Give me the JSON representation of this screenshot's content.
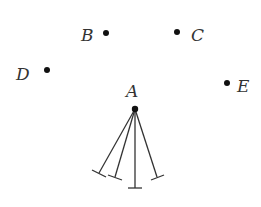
{
  "diagram": {
    "points": [
      {
        "id": "A",
        "label": "A",
        "x": 135,
        "y": 109,
        "lx": 126,
        "ly": 97
      },
      {
        "id": "B",
        "label": "B",
        "x": 106,
        "y": 33,
        "lx": 81,
        "ly": 41
      },
      {
        "id": "C",
        "label": "C",
        "x": 177,
        "y": 32,
        "lx": 191,
        "ly": 41
      },
      {
        "id": "D",
        "label": "D",
        "x": 47,
        "y": 70,
        "lx": 16,
        "ly": 80
      },
      {
        "id": "E",
        "label": "E",
        "x": 227,
        "y": 83,
        "lx": 237,
        "ly": 92
      }
    ],
    "stems_from": "A",
    "stems": [
      {
        "x2": 99,
        "y2": 173
      },
      {
        "x2": 115,
        "y2": 177
      },
      {
        "x2": 135,
        "y2": 188
      },
      {
        "x2": 157,
        "y2": 177
      }
    ],
    "colors": {
      "ink": "#333333",
      "dot": "#111111"
    }
  }
}
